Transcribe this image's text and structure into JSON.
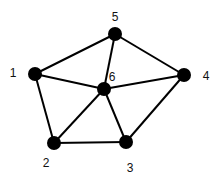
{
  "diagram": {
    "type": "undirected-graph",
    "nodes": [
      {
        "id": "1",
        "label": "1",
        "x": 35,
        "y": 74,
        "lx": 13,
        "ly": 77
      },
      {
        "id": "2",
        "label": "2",
        "x": 54,
        "y": 143,
        "lx": 46,
        "ly": 167
      },
      {
        "id": "3",
        "label": "3",
        "x": 126,
        "y": 142,
        "lx": 130,
        "ly": 172
      },
      {
        "id": "4",
        "label": "4",
        "x": 184,
        "y": 75,
        "lx": 206,
        "ly": 80
      },
      {
        "id": "5",
        "label": "5",
        "x": 115,
        "y": 34,
        "lx": 115,
        "ly": 21
      },
      {
        "id": "6",
        "label": "6",
        "x": 104,
        "y": 89,
        "lx": 112,
        "ly": 81
      }
    ],
    "edges": [
      [
        "1",
        "5"
      ],
      [
        "5",
        "4"
      ],
      [
        "1",
        "2"
      ],
      [
        "2",
        "3"
      ],
      [
        "3",
        "4"
      ],
      [
        "6",
        "1"
      ],
      [
        "6",
        "2"
      ],
      [
        "6",
        "3"
      ],
      [
        "6",
        "4"
      ],
      [
        "6",
        "5"
      ]
    ],
    "colors": {
      "node": "#000000",
      "edge": "#000000",
      "label": "#111111"
    }
  }
}
